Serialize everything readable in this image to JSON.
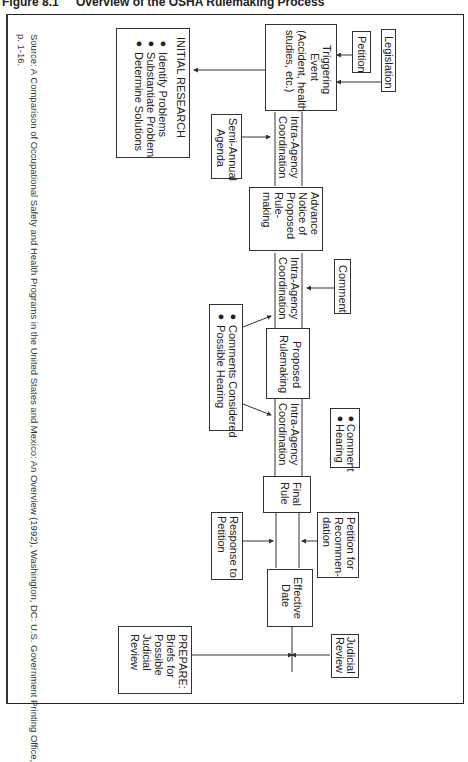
{
  "figure": {
    "number": "Figure 8.1",
    "title": "Overview of the OSHA Rulemaking Process"
  },
  "nodes": {
    "legislation": "Legislation",
    "petition": "Petition",
    "triggering_event": [
      "Triggering",
      "Event",
      "(Accident, health",
      "studies, etc.)"
    ],
    "initial_research": {
      "heading": "INITIAL RESEARCH",
      "bullets": [
        "Identify Problems",
        "Substantiate Problem",
        "Determine Solutions"
      ]
    },
    "semi_annual_agenda": [
      "Semi-Annual",
      "Agenda"
    ],
    "coordination_1": [
      "Intra-Agency",
      "Coordination"
    ],
    "anpr": [
      "Advance",
      "Notice of",
      "Proposed",
      "Rule-",
      "making"
    ],
    "comment": "Comment",
    "coordination_2": [
      "Intra-Agency",
      "Coordination"
    ],
    "comments_considered": {
      "bullets": [
        "Comments Considered",
        "Possible Hearing"
      ]
    },
    "proposed_rulemaking": [
      "Proposed",
      "Rulemaking"
    ],
    "comment_hearing": {
      "bullets": [
        "Comment",
        "Hearing"
      ]
    },
    "coordination_3": [
      "Intra-Agency",
      "Coordination"
    ],
    "final_rule": [
      "Final",
      "Rule"
    ],
    "petition_reconsideration": [
      "Petition for",
      "Recommen-",
      "dation"
    ],
    "response_to_petition": [
      "Response to",
      "Petition"
    ],
    "effective_date": [
      "Effective",
      "Date"
    ],
    "judicial_review": [
      "Judicial",
      "Review"
    ],
    "prepare": [
      "PREPARE:",
      "Briefs for",
      "Possible",
      "Judicial",
      "Review"
    ]
  },
  "source": {
    "line1": "Source: A Comparison of Occupational Safety and Health Programs in the United States and Mexico: An Overview (1992), Washington, DC: U.S. Government Printing Office,",
    "line2": "p. 1-16."
  }
}
